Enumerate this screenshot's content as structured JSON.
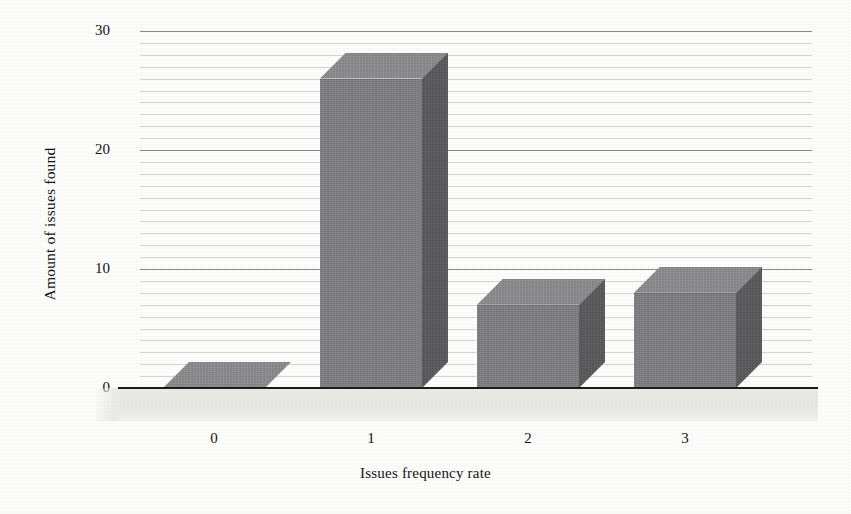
{
  "chart_data": {
    "type": "bar",
    "title": "",
    "subtitle": "",
    "xlabel": "Issues frequency rate",
    "ylabel": "Amount of issues found",
    "categories": [
      "0",
      "1",
      "2",
      "3"
    ],
    "values": [
      0,
      26,
      7,
      8
    ],
    "ylim": [
      0,
      30
    ],
    "y_major_ticks": [
      "0",
      "10",
      "20",
      "30"
    ],
    "y_major_tick_values": [
      0,
      10,
      20,
      30
    ],
    "y_minor_tick_step": 1,
    "grid": true,
    "grid_axis": "y",
    "legend": false,
    "legend_position": "none",
    "three_d": true,
    "style": {
      "bar_front_color": "#818184",
      "bar_side_color": "#5b5b5e",
      "bar_top_color": "#8d8d90",
      "floor_color": "#e8e8e6",
      "axis_line_color": "#1b1b1b",
      "grid_major_color": "#46464b",
      "grid_minor_color": "#78787d",
      "background_color": "#fdfdfc",
      "text_color": "#131313"
    }
  },
  "axes": {
    "y_title": "Amount of issues found",
    "x_title": "Issues frequency rate",
    "y_ticks": [
      {
        "label": "30",
        "value": 30
      },
      {
        "label": "20",
        "value": 20
      },
      {
        "label": "10",
        "value": 10
      },
      {
        "label": "0",
        "value": 0
      }
    ],
    "x_ticks": [
      {
        "label": "0"
      },
      {
        "label": "1"
      },
      {
        "label": "2"
      },
      {
        "label": "3"
      }
    ]
  }
}
